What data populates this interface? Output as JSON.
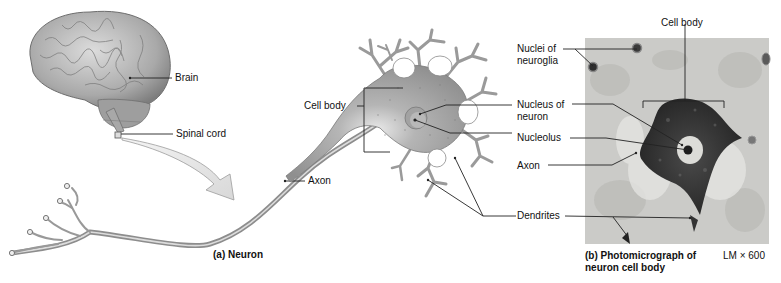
{
  "figure": {
    "panel_a": {
      "caption": "(a) Neuron",
      "labels": {
        "brain": "Brain",
        "spinal_cord": "Spinal cord",
        "axon": "Axon",
        "cell_body": "Cell body",
        "nucleus_of_neuron_line1": "Nucleus of",
        "nucleus_of_neuron_line2": "neuron",
        "nucleolus": "Nucleolus",
        "dendrites": "Dendrites"
      }
    },
    "panel_b": {
      "caption_line1": "(b) Photomicrograph of",
      "caption_line2": "neuron cell body",
      "magnification": "LM × 600",
      "labels": {
        "cell_body": "Cell body",
        "nuclei_of_neuroglia_line1": "Nuclei of",
        "nuclei_of_neuroglia_line2": "neuroglia",
        "axon": "Axon"
      }
    },
    "colors": {
      "background": "#ffffff",
      "leader_line": "#222222",
      "neuron_gray": "#9a9a9a",
      "micrograph_bg": "#c9c9c6",
      "stain_dark": "#2e2e2e"
    }
  }
}
